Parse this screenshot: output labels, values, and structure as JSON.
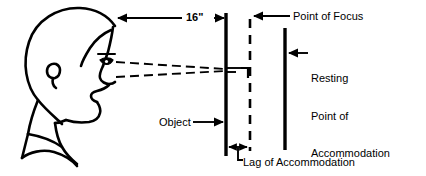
{
  "diagram": {
    "labels": {
      "distance": "16\"",
      "point_of_focus": "Point of Focus",
      "resting_point": "Resting\nPoint of\nAccommodation\n(RPA)",
      "resting_point_line1": "Resting",
      "resting_point_line2": "Point of",
      "resting_point_line3": "Accommodation",
      "resting_point_line4": "(RPA)",
      "object": "Object",
      "lag": "Lag of Accommodation"
    },
    "colors": {
      "ink": "#000000",
      "background": "#ffffff"
    },
    "geometry": {
      "object_plane_x": 226,
      "focus_plane_x": 250,
      "rpa_plane_x": 285,
      "eye_x": 113,
      "eye_y": 69,
      "dimension_line_y": 18,
      "lag_dimension_y": 147
    }
  }
}
